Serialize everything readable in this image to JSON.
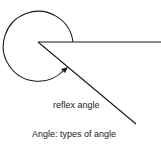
{
  "diagram": {
    "title": "Angle: types of angle",
    "label": "reflex angle",
    "stroke_color": "#1a1a1a"
  }
}
